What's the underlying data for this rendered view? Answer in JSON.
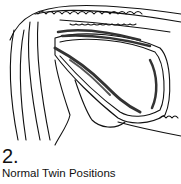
{
  "figure": {
    "number": "2.",
    "caption": "Normal Twin Positions",
    "line_color": "#111111",
    "background": "#ffffff"
  }
}
